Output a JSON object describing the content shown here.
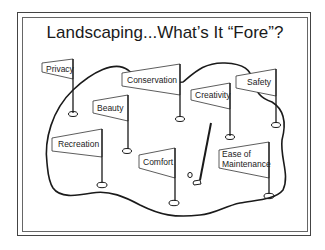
{
  "slide": {
    "title": "Landscaping...What’s It “Fore”?",
    "flags": [
      {
        "id": "privacy",
        "label": "Privacy"
      },
      {
        "id": "conservation",
        "label": "Conservation"
      },
      {
        "id": "creativity",
        "label": "Creativity"
      },
      {
        "id": "safety",
        "label": "Safety"
      },
      {
        "id": "beauty",
        "label": "Beauty"
      },
      {
        "id": "recreation",
        "label": "Recreation"
      },
      {
        "id": "comfort",
        "label": "Comfort"
      },
      {
        "id": "ease-of-maintenance",
        "label_line1": "Ease of",
        "label_line2": "Maintenance"
      }
    ],
    "colors": {
      "ink": "#1a1a1a",
      "background": "#ffffff",
      "frame": "#555555"
    }
  }
}
